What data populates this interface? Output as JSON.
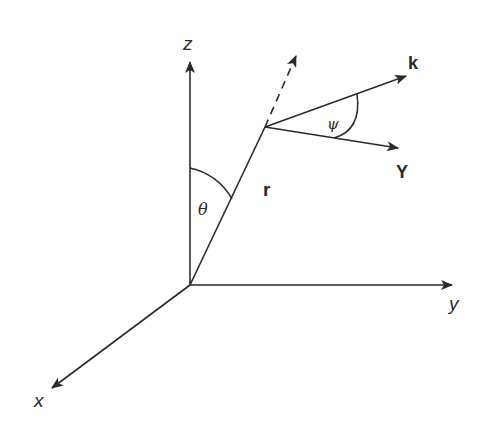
{
  "diagram": {
    "type": "3d-coordinate-system",
    "colors": {
      "stroke": "#2a2a2a",
      "background": "#ffffff"
    },
    "axes": [
      {
        "id": "z",
        "label": "z"
      },
      {
        "id": "y",
        "label": "y"
      },
      {
        "id": "x",
        "label": "x"
      }
    ],
    "vectors": [
      {
        "id": "r",
        "label": "r"
      },
      {
        "id": "k",
        "label": "k"
      },
      {
        "id": "Y",
        "label": "Y"
      }
    ],
    "angles": [
      {
        "id": "theta",
        "label": "θ",
        "between": "z-axis and r"
      },
      {
        "id": "psi",
        "label": "ψ",
        "between": "k and Y"
      }
    ],
    "extension": {
      "id": "r-extension",
      "style": "dashed"
    }
  }
}
